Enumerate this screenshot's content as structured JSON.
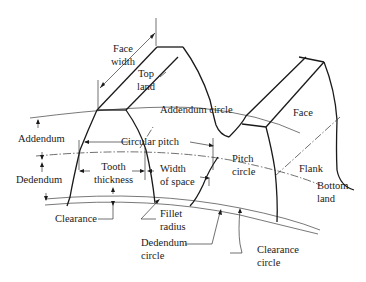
{
  "diagram": {
    "type": "gear-tooth-nomenclature",
    "labels": {
      "face_width": [
        "Face",
        "width"
      ],
      "top_land": [
        "Top",
        "land"
      ],
      "addendum_circle": "Addendum circle",
      "face": "Face",
      "addendum": "Addendum",
      "circular_pitch": "Circular pitch",
      "dedendum": "Dedendum",
      "tooth_thickness": [
        "Tooth",
        "thickness"
      ],
      "width_of_space": [
        "Width",
        "of space"
      ],
      "pitch_circle": [
        "Pitch",
        "circle"
      ],
      "flank": "Flank",
      "bottom_land": [
        "Bottom",
        "land"
      ],
      "clearance": "Clearance",
      "fillet_radius": [
        "Fillet",
        "radius"
      ],
      "dedendum_circle": [
        "Dedendum",
        "circle"
      ],
      "clearance_circle": [
        "Clearance",
        "circle"
      ]
    },
    "colors": {
      "line": "#1a1a1a",
      "background": "#ffffff"
    }
  }
}
